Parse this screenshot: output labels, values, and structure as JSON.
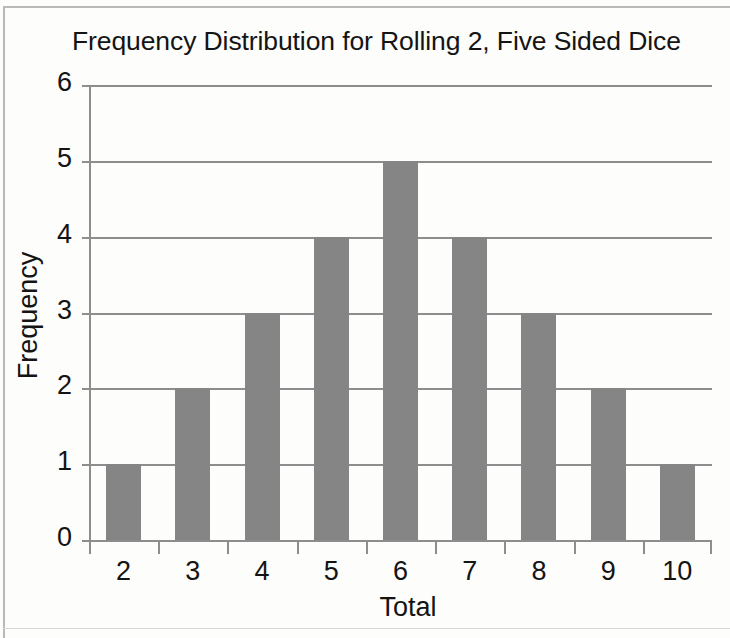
{
  "chart_data": {
    "type": "bar",
    "title": "Frequency Distribution for Rolling 2, Five Sided Dice",
    "xlabel": "Total",
    "ylabel": "Frequency",
    "categories": [
      "2",
      "3",
      "4",
      "5",
      "6",
      "7",
      "8",
      "9",
      "10"
    ],
    "values": [
      1,
      2,
      3,
      4,
      5,
      4,
      3,
      2,
      1
    ],
    "ylim": [
      0,
      6
    ],
    "ytick_labels": [
      "0",
      "1",
      "2",
      "3",
      "4",
      "5",
      "6"
    ],
    "ytick_values": [
      0,
      1,
      2,
      3,
      4,
      5,
      6
    ],
    "xtick_labels": [
      "2",
      "3",
      "4",
      "5",
      "6",
      "7",
      "8",
      "9",
      "10"
    ],
    "grid": true,
    "grid_axis": "y",
    "legend": false,
    "legend_position": "none",
    "bar_color": "#858585",
    "grid_color": "#8d8d8d",
    "axis_color": "#8d8d8d",
    "text_color": "#141414",
    "background_color": "#fdfdfb"
  }
}
